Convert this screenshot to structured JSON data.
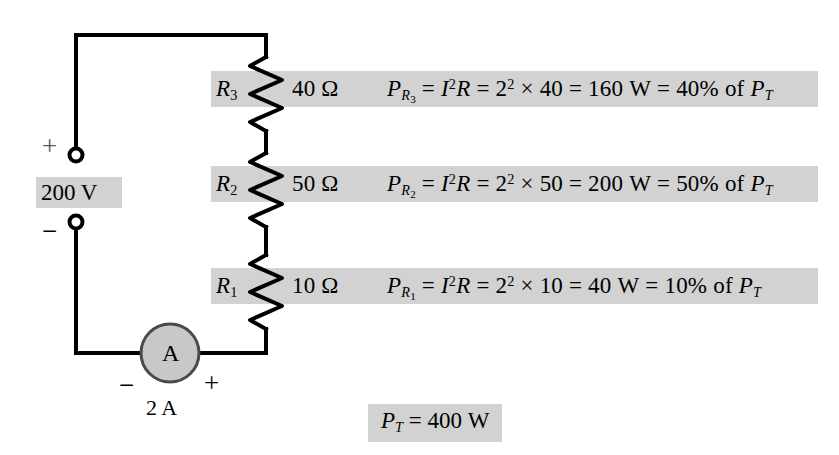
{
  "figure": {
    "type": "series-circuit-power-diagram",
    "source": {
      "label": "200 V",
      "plus_sign": "+",
      "minus_sign": "−",
      "voltage_value": 200,
      "voltage_unit": "V"
    },
    "ammeter": {
      "symbol": "A",
      "reading": "2 A",
      "current_value": 2,
      "current_unit": "A",
      "left_sign": "−",
      "right_sign": "+"
    },
    "total": {
      "text": "P_T = 400 W",
      "symbol": "P",
      "subscript": "T",
      "equals": "=",
      "value": "400",
      "unit": "W"
    },
    "rows": [
      {
        "name": "R_3",
        "ref_symbol": "R",
        "ref_sub": "3",
        "resistance": "40",
        "ohm_unit": "Ω",
        "power_symbol": "P",
        "power_sub_symbol": "R",
        "power_sub_index": "3",
        "formula": "I²R",
        "current_squared": "2",
        "exponent": "2",
        "times": "×",
        "multiplier": "40",
        "power_value": "160",
        "power_unit": "W",
        "percent": "40%",
        "of_text": "of",
        "of_symbol": "P",
        "of_sub": "T"
      },
      {
        "name": "R_2",
        "ref_symbol": "R",
        "ref_sub": "2",
        "resistance": "50",
        "ohm_unit": "Ω",
        "power_symbol": "P",
        "power_sub_symbol": "R",
        "power_sub_index": "2",
        "formula": "I²R",
        "current_squared": "2",
        "exponent": "2",
        "times": "×",
        "multiplier": "50",
        "power_value": "200",
        "power_unit": "W",
        "percent": "50%",
        "of_text": "of",
        "of_symbol": "P",
        "of_sub": "T"
      },
      {
        "name": "R_1",
        "ref_symbol": "R",
        "ref_sub": "1",
        "resistance": "10",
        "ohm_unit": "Ω",
        "power_symbol": "P",
        "power_sub_symbol": "R",
        "power_sub_index": "1",
        "formula": "I²R",
        "current_squared": "2",
        "exponent": "2",
        "times": "×",
        "multiplier": "10",
        "power_value": "40",
        "power_unit": "W",
        "percent": "10%",
        "of_text": "of",
        "of_symbol": "P",
        "of_sub": "T"
      }
    ],
    "colors": {
      "highlight": "#d2d2d2",
      "wire": "#000000",
      "meter_fill": "#c8c8c8",
      "background": "#ffffff"
    }
  }
}
